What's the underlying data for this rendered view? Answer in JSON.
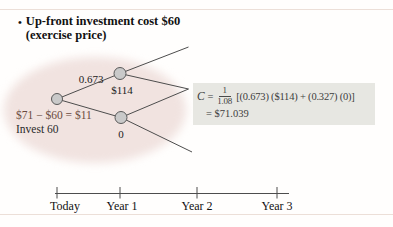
{
  "title": {
    "bullet": "•",
    "line1": "Up-front investment cost $60",
    "line2": "(exercise price)"
  },
  "tree": {
    "probability_up_label": "0.673",
    "up_node_value": "$114",
    "down_node_value": "0",
    "npv_line": "$71 − $60 = $11",
    "invest_line": "Invest 60"
  },
  "formula": {
    "lhs": "C",
    "equals_sign": "=",
    "fraction_numerator": "1",
    "fraction_denominator": "1.08",
    "bracket_expression": "[(0.673) ($114) + (0.327) (0)]",
    "result_line": "= $71.039"
  },
  "timeline": {
    "labels": [
      "Today",
      "Year 1",
      "Year 2",
      "Year 3"
    ]
  },
  "colors": {
    "formula_box_bg": "#e7e7e2",
    "node_fill": "#c9c9c9",
    "node_stroke": "#595959",
    "branch_line": "#4d4d4d",
    "watermark_pink": "#f1e3e0",
    "npv_text": "#6a4a3e"
  }
}
